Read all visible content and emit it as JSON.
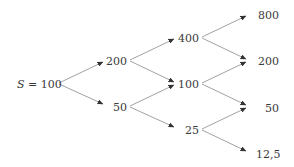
{
  "diagram": {
    "type": "binomial-tree",
    "line_color": "#8a8a8a",
    "arrow_color": "#333333",
    "root": {
      "var": "S",
      "eq": " = ",
      "value": "100"
    },
    "levels": [
      {
        "step": 1,
        "nodes": [
          "200",
          "50"
        ]
      },
      {
        "step": 2,
        "nodes": [
          "400",
          "100",
          "25"
        ]
      },
      {
        "step": 3,
        "nodes": [
          "800",
          "200",
          "50",
          "12,5"
        ]
      }
    ],
    "nodes": [
      {
        "id": "n0",
        "label": "S = 100",
        "x": 17,
        "y": 84
      },
      {
        "id": "n1u",
        "label": "200",
        "x": 106,
        "y": 61
      },
      {
        "id": "n1d",
        "label": "50",
        "x": 113,
        "y": 107
      },
      {
        "id": "n2uu",
        "label": "400",
        "x": 178,
        "y": 38
      },
      {
        "id": "n2ud",
        "label": "100",
        "x": 178,
        "y": 84
      },
      {
        "id": "n2dd",
        "label": "25",
        "x": 185,
        "y": 130
      },
      {
        "id": "n3a",
        "label": "800",
        "x": 258,
        "y": 15
      },
      {
        "id": "n3b",
        "label": "200",
        "x": 258,
        "y": 61
      },
      {
        "id": "n3c",
        "label": "50",
        "x": 265,
        "y": 108
      },
      {
        "id": "n3d",
        "label": "12,5",
        "x": 256,
        "y": 154
      }
    ],
    "edges": [
      {
        "from": "n0",
        "to": "n1u",
        "x1": 59,
        "y1": 83,
        "x2": 103,
        "y2": 62
      },
      {
        "from": "n0",
        "to": "n1d",
        "x1": 59,
        "y1": 84,
        "x2": 103,
        "y2": 104
      },
      {
        "from": "n1u",
        "to": "n2uu",
        "x1": 130,
        "y1": 60,
        "x2": 174,
        "y2": 39
      },
      {
        "from": "n1u",
        "to": "n2ud",
        "x1": 130,
        "y1": 61,
        "x2": 174,
        "y2": 82
      },
      {
        "from": "n1d",
        "to": "n2ud",
        "x1": 130,
        "y1": 106,
        "x2": 174,
        "y2": 85
      },
      {
        "from": "n1d",
        "to": "n2dd",
        "x1": 130,
        "y1": 107,
        "x2": 174,
        "y2": 127
      },
      {
        "from": "n2uu",
        "to": "n3a",
        "x1": 202,
        "y1": 37,
        "x2": 246,
        "y2": 16
      },
      {
        "from": "n2uu",
        "to": "n3b",
        "x1": 202,
        "y1": 38,
        "x2": 246,
        "y2": 59
      },
      {
        "from": "n2ud",
        "to": "n3b",
        "x1": 202,
        "y1": 83,
        "x2": 246,
        "y2": 62
      },
      {
        "from": "n2ud",
        "to": "n3c",
        "x1": 202,
        "y1": 84,
        "x2": 246,
        "y2": 105
      },
      {
        "from": "n2dd",
        "to": "n3c",
        "x1": 202,
        "y1": 129,
        "x2": 246,
        "y2": 108
      },
      {
        "from": "n2dd",
        "to": "n3d",
        "x1": 202,
        "y1": 130,
        "x2": 246,
        "y2": 151
      }
    ]
  }
}
